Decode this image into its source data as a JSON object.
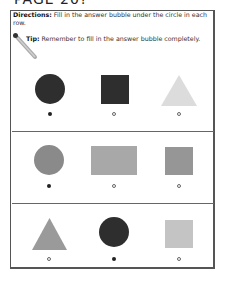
{
  "page_title": "PAGE 20?",
  "directions": {
    "label": "Directions:",
    "text": " Fill in the answer bubble under the circle in each row."
  },
  "tip": {
    "icon": "pencil-icon",
    "label": "Tip:",
    "text": " Remember to fill in the answer bubble completely."
  },
  "colors": {
    "dark": "#2e2e2e",
    "medium": "#8a8a8a",
    "light_gray": "#a8a8a8",
    "pale": "#dcdcdc",
    "frame": "#555555"
  },
  "rows": [
    {
      "items": [
        {
          "shape": "circle",
          "color": "dark",
          "bubble": "filled"
        },
        {
          "shape": "square",
          "color": "dark",
          "bubble": "empty"
        },
        {
          "shape": "triangle",
          "color": "pale",
          "bubble": "empty"
        }
      ]
    },
    {
      "items": [
        {
          "shape": "circle",
          "color": "medium",
          "bubble": "filled"
        },
        {
          "shape": "rectangle",
          "color": "light_gray",
          "bubble": "empty"
        },
        {
          "shape": "square",
          "color": "medium",
          "bubble": "empty"
        }
      ]
    },
    {
      "items": [
        {
          "shape": "triangle",
          "color": "medium",
          "bubble": "empty"
        },
        {
          "shape": "circle",
          "color": "dark",
          "bubble": "filled"
        },
        {
          "shape": "square",
          "color": "light_gray",
          "bubble": "empty"
        }
      ]
    }
  ]
}
